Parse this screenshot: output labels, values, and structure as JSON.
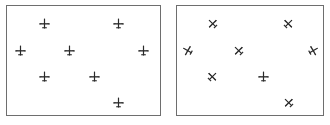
{
  "figure": {
    "icon": "airplane-icon",
    "colors": {
      "icon": "#2a2a2a",
      "border": "#6e6e6e",
      "background": "#ffffff"
    }
  },
  "panels": [
    {
      "id": "left",
      "planes": [
        {
          "x": 44,
          "y": 23,
          "rotation": 0
        },
        {
          "x": 118,
          "y": 23,
          "rotation": 0
        },
        {
          "x": 20,
          "y": 50,
          "rotation": 0
        },
        {
          "x": 69,
          "y": 50,
          "rotation": 0
        },
        {
          "x": 143,
          "y": 50,
          "rotation": 0
        },
        {
          "x": 44,
          "y": 76,
          "rotation": 0
        },
        {
          "x": 94,
          "y": 76,
          "rotation": 0
        },
        {
          "x": 118,
          "y": 102,
          "rotation": 0
        }
      ]
    },
    {
      "id": "right",
      "planes": [
        {
          "x": 212,
          "y": 23,
          "rotation": -45
        },
        {
          "x": 288,
          "y": 23,
          "rotation": 45
        },
        {
          "x": 187,
          "y": 50,
          "rotation": -60
        },
        {
          "x": 238,
          "y": 50,
          "rotation": -45
        },
        {
          "x": 313,
          "y": 50,
          "rotation": 60
        },
        {
          "x": 212,
          "y": 76,
          "rotation": 45
        },
        {
          "x": 263,
          "y": 76,
          "rotation": 0
        },
        {
          "x": 288,
          "y": 102,
          "rotation": -45
        }
      ]
    }
  ]
}
